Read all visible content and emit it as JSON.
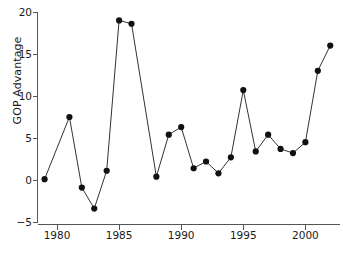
{
  "chart_data": {
    "type": "line",
    "title": "",
    "xlabel": "",
    "ylabel": "GOP Advantage",
    "xlim": [
      1978.2,
      2002.8
    ],
    "ylim": [
      -5.8,
      20.8
    ],
    "grid": false,
    "legend": null,
    "marker": "filled-circle",
    "x_ticks": [
      1980,
      1985,
      1990,
      1995,
      2000
    ],
    "x_tick_labels": [
      "1980",
      "1985",
      "1990",
      "1995",
      "2000"
    ],
    "y_ticks": [
      -5,
      0,
      5,
      10,
      15,
      20
    ],
    "y_tick_labels": [
      "−5",
      "0",
      "5",
      "10",
      "15",
      "20"
    ],
    "x": [
      1979,
      1981,
      1982,
      1983,
      1984,
      1985,
      1986,
      1988,
      1989,
      1990,
      1991,
      1992,
      1993,
      1994,
      1995,
      1996,
      1997,
      1998,
      1999,
      2000,
      2001,
      2002
    ],
    "values": [
      0.1,
      7.5,
      -0.9,
      -3.4,
      1.1,
      19.0,
      18.6,
      0.4,
      5.4,
      6.3,
      1.4,
      2.2,
      0.8,
      2.7,
      10.7,
      3.4,
      5.4,
      3.7,
      3.2,
      4.5,
      13.0,
      16.0
    ],
    "series": [
      {
        "name": "GOP Advantage",
        "color": "#111111",
        "x": [
          1979,
          1981,
          1982,
          1983,
          1984,
          1985,
          1986,
          1988,
          1989,
          1990,
          1991,
          1992,
          1993,
          1994,
          1995,
          1996,
          1997,
          1998,
          1999,
          2000,
          2001,
          2002
        ],
        "values": [
          0.1,
          7.5,
          -0.9,
          -3.4,
          1.1,
          19.0,
          18.6,
          0.4,
          5.4,
          6.3,
          1.4,
          2.2,
          0.8,
          2.7,
          10.7,
          3.4,
          5.4,
          3.7,
          3.2,
          4.5,
          13.0,
          16.0
        ]
      }
    ],
    "axis_color": "#555555",
    "line_color": "#333333",
    "marker_color": "#111111",
    "background": "#ffffff"
  }
}
